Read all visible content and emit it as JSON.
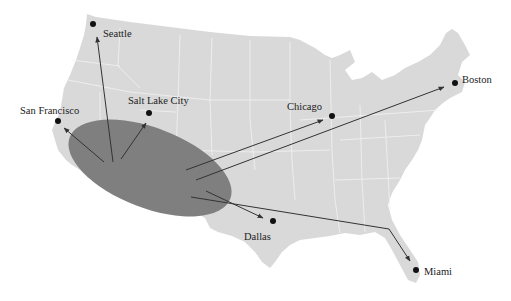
{
  "map": {
    "title": "",
    "colors": {
      "land": "#d9d9d9",
      "borders": "#f2f2f2",
      "region": "#7f7f7f",
      "arrows": "#333333",
      "dots": "#111111",
      "text": "#222222"
    },
    "source_region": {
      "description": "Southwest origin region",
      "cx": 150,
      "cy": 168,
      "rx": 86,
      "ry": 40,
      "rotation_deg": 21
    },
    "cities": [
      {
        "name": "Seattle",
        "dot": [
          93,
          24
        ],
        "label_pos": [
          103,
          29
        ]
      },
      {
        "name": "San Francisco",
        "dot": [
          58,
          121
        ],
        "label_pos": [
          20,
          106
        ]
      },
      {
        "name": "Salt Lake City",
        "dot": [
          149,
          113
        ],
        "label_pos": [
          128,
          96
        ]
      },
      {
        "name": "Chicago",
        "dot": [
          332,
          116
        ],
        "label_pos": [
          287,
          102
        ]
      },
      {
        "name": "Boston",
        "dot": [
          455,
          83
        ],
        "label_pos": [
          462,
          75
        ]
      },
      {
        "name": "Dallas",
        "dot": [
          273,
          221
        ],
        "label_pos": [
          244,
          232
        ]
      },
      {
        "name": "Miami",
        "dot": [
          416,
          270
        ],
        "label_pos": [
          424,
          267
        ]
      }
    ],
    "arrows": [
      {
        "to": "Seattle",
        "points": [
          [
            113,
            162
          ],
          [
            97,
            37
          ]
        ]
      },
      {
        "to": "San Francisco",
        "points": [
          [
            104,
            162
          ],
          [
            64,
            128
          ]
        ]
      },
      {
        "to": "Salt Lake City",
        "points": [
          [
            121,
            159
          ],
          [
            146,
            123
          ]
        ]
      },
      {
        "to": "Chicago",
        "points": [
          [
            186,
            170
          ],
          [
            323,
            120
          ]
        ]
      },
      {
        "to": "Boston",
        "points": [
          [
            196,
            180
          ],
          [
            444,
            87
          ]
        ]
      },
      {
        "to": "Dallas",
        "points": [
          [
            206,
            191
          ],
          [
            263,
            218
          ]
        ]
      },
      {
        "to": "Miami",
        "points": [
          [
            191,
            197
          ],
          [
            389,
            229
          ],
          [
            410,
            261
          ]
        ]
      }
    ]
  }
}
